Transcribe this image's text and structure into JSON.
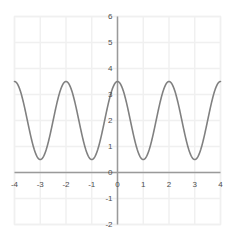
{
  "chart_data": {
    "type": "line",
    "title": "",
    "subtitle": "",
    "xlabel": "",
    "ylabel": "",
    "xlim": [
      -4,
      4
    ],
    "ylim": [
      -2,
      6
    ],
    "grid": true,
    "legend": null,
    "legend_position": "none",
    "xticks": [
      "-4",
      "-3",
      "-2",
      "-1",
      "0",
      "1",
      "2",
      "3",
      "4"
    ],
    "xtick_values": [
      -4,
      -3,
      -2,
      -1,
      0,
      1,
      2,
      3,
      4
    ],
    "yticks": [
      "-2",
      "-1",
      "0",
      "1",
      "2",
      "3",
      "4",
      "5",
      "6"
    ],
    "ytick_values": [
      -2,
      -1,
      0,
      1,
      2,
      3,
      4,
      5,
      6
    ],
    "series": [
      {
        "name": "y = 1.5*cos(pi*x) + 2",
        "color": "#808080",
        "line_width": 1.6,
        "amplitude": 1.5,
        "midline": 2,
        "period": 2,
        "maximum": 3.5,
        "minimum": 0.5,
        "maxima_at_x": [
          -4,
          -2,
          0,
          2,
          4
        ],
        "minima_at_x": [
          -3,
          -1,
          1,
          3
        ],
        "x": [
          -4,
          -3.75,
          -3.5,
          -3.25,
          -3,
          -2.75,
          -2.5,
          -2.25,
          -2,
          -1.75,
          -1.5,
          -1.25,
          -1,
          -0.75,
          -0.5,
          -0.25,
          0,
          0.25,
          0.5,
          0.75,
          1,
          1.25,
          1.5,
          1.75,
          2,
          2.25,
          2.5,
          2.75,
          3,
          3.25,
          3.5,
          3.75,
          4
        ],
        "values": [
          3.5,
          3.06,
          2,
          0.94,
          0.5,
          0.94,
          2,
          3.06,
          3.5,
          3.06,
          2,
          0.94,
          0.5,
          0.94,
          2,
          3.06,
          3.5,
          3.06,
          2,
          0.94,
          0.5,
          0.94,
          2,
          3.06,
          3.5,
          3.06,
          2,
          0.94,
          0.5,
          0.94,
          2,
          3.06,
          3.5
        ]
      }
    ],
    "colors": {
      "curve": "#808080",
      "grid": "#f0f0f0",
      "axis": "#9a9a9a",
      "tick_label": "#4d4d4d",
      "background": "#ffffff"
    }
  }
}
